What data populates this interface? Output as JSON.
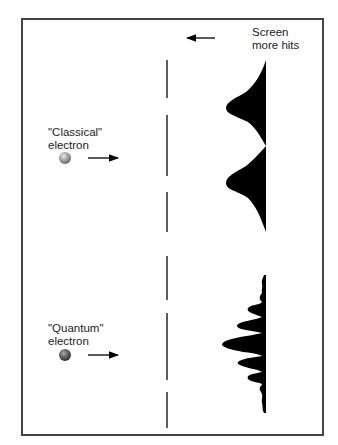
{
  "screen_label": {
    "line1": "Screen",
    "line2": "more hits"
  },
  "classical": {
    "label_line1": "\"Classical\"",
    "label_line2": "electron",
    "electron_color": "#9a9a9a"
  },
  "quantum": {
    "label_line1": "\"Quantum\"",
    "label_line2": "electron",
    "electron_color": "#5a5a5a"
  },
  "colors": {
    "frame": "#444444",
    "ink": "#000000",
    "barrier": "#333333",
    "background": "#ffffff"
  }
}
